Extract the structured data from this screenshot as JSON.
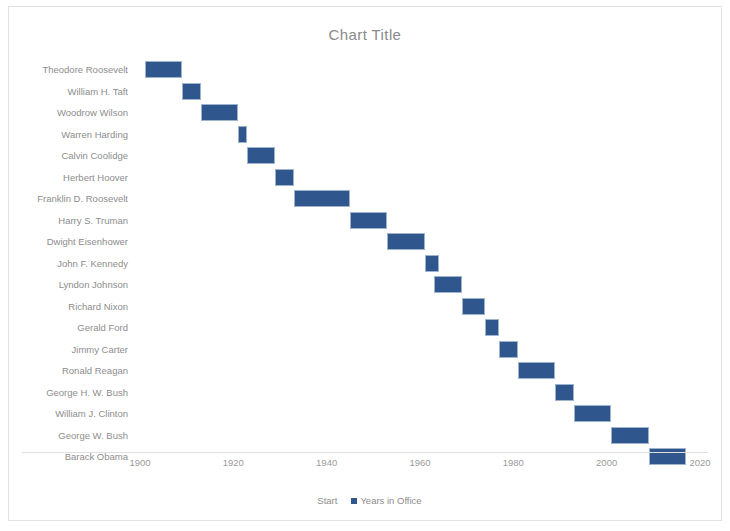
{
  "chart": {
    "title": "Chart Title",
    "frame_color": "#e2e2e2",
    "bar_color": "#30578d",
    "text_color": "#8d8d8d"
  },
  "legend": {
    "position": "bottom",
    "entries": [
      {
        "label": "Start",
        "marker": "none",
        "color": "#ffffff"
      },
      {
        "label": "Years in Office",
        "marker": "square",
        "color": "#30578d"
      }
    ]
  },
  "chart_data": {
    "type": "bar",
    "orientation": "horizontal",
    "subtype": "gantt",
    "title": "Chart Title",
    "xlabel": "",
    "ylabel": "",
    "xlim": [
      1900,
      2020
    ],
    "xticks": [
      1900,
      1920,
      1940,
      1960,
      1980,
      2000,
      2020
    ],
    "grid": false,
    "categories": [
      "Theodore Roosevelt",
      "William H. Taft",
      "Woodrow Wilson",
      "Warren Harding",
      "Calvin Coolidge",
      "Herbert Hoover",
      "Franklin D. Roosevelt",
      "Harry S. Truman",
      "Dwight Eisenhower",
      "John F. Kennedy",
      "Lyndon Johnson",
      "Richard Nixon",
      "Gerald Ford",
      "Jimmy Carter",
      "Ronald Reagan",
      "George H. W. Bush",
      "William J. Clinton",
      "George W. Bush",
      "Barack Obama"
    ],
    "series": [
      {
        "name": "Start",
        "visible": false,
        "values": [
          1901,
          1909,
          1913,
          1921,
          1923,
          1929,
          1933,
          1945,
          1953,
          1961,
          1963,
          1969,
          1974,
          1977,
          1981,
          1989,
          1993,
          2001,
          2009
        ]
      },
      {
        "name": "Years in Office",
        "visible": true,
        "color": "#30578d",
        "values": [
          8,
          4,
          8,
          2,
          6,
          4,
          12,
          8,
          8,
          3,
          6,
          5,
          3,
          4,
          8,
          4,
          8,
          8,
          8
        ]
      }
    ],
    "bars": [
      {
        "label": "Theodore Roosevelt",
        "start": 1901,
        "duration": 8,
        "end": 1909
      },
      {
        "label": "William H. Taft",
        "start": 1909,
        "duration": 4,
        "end": 1913
      },
      {
        "label": "Woodrow Wilson",
        "start": 1913,
        "duration": 8,
        "end": 1921
      },
      {
        "label": "Warren Harding",
        "start": 1921,
        "duration": 2,
        "end": 1923
      },
      {
        "label": "Calvin Coolidge",
        "start": 1923,
        "duration": 6,
        "end": 1929
      },
      {
        "label": "Herbert Hoover",
        "start": 1929,
        "duration": 4,
        "end": 1933
      },
      {
        "label": "Franklin D. Roosevelt",
        "start": 1933,
        "duration": 12,
        "end": 1945
      },
      {
        "label": "Harry S. Truman",
        "start": 1945,
        "duration": 8,
        "end": 1953
      },
      {
        "label": "Dwight Eisenhower",
        "start": 1953,
        "duration": 8,
        "end": 1961
      },
      {
        "label": "John F. Kennedy",
        "start": 1961,
        "duration": 3,
        "end": 1964
      },
      {
        "label": "Lyndon Johnson",
        "start": 1963,
        "duration": 6,
        "end": 1969
      },
      {
        "label": "Richard Nixon",
        "start": 1969,
        "duration": 5,
        "end": 1974
      },
      {
        "label": "Gerald Ford",
        "start": 1974,
        "duration": 3,
        "end": 1977
      },
      {
        "label": "Jimmy Carter",
        "start": 1977,
        "duration": 4,
        "end": 1981
      },
      {
        "label": "Ronald Reagan",
        "start": 1981,
        "duration": 8,
        "end": 1989
      },
      {
        "label": "George H. W. Bush",
        "start": 1989,
        "duration": 4,
        "end": 1993
      },
      {
        "label": "William J. Clinton",
        "start": 1993,
        "duration": 8,
        "end": 2001
      },
      {
        "label": "George W. Bush",
        "start": 2001,
        "duration": 8,
        "end": 2009
      },
      {
        "label": "Barack Obama",
        "start": 2009,
        "duration": 8,
        "end": 2017
      }
    ]
  }
}
